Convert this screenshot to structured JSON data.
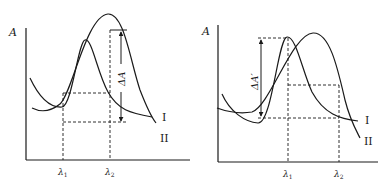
{
  "figure": {
    "panels": [
      {
        "id": "left",
        "y_axis_label": "A",
        "x_ticks": [
          {
            "symbol": "λ",
            "subscript": "1"
          },
          {
            "symbol": "λ",
            "subscript": "2"
          }
        ],
        "delta_label": "ΔA",
        "curve_labels": [
          "I",
          "II"
        ]
      },
      {
        "id": "right",
        "y_axis_label": "A",
        "x_ticks": [
          {
            "symbol": "λ",
            "subscript": "1"
          },
          {
            "symbol": "λ",
            "subscript": "2"
          }
        ],
        "delta_label": "ΔA′",
        "curve_labels": [
          "I",
          "II"
        ]
      }
    ]
  }
}
